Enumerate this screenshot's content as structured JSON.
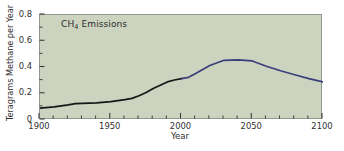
{
  "chart_data": {
    "type": "line",
    "title": "CH4 Emissions",
    "title_html": "CH<sub>4</sub> Emissions",
    "xlabel": "Year",
    "ylabel": "Teragrams Methane per Year",
    "xlim": [
      1900,
      2100
    ],
    "ylim": [
      0,
      0.8
    ],
    "grid": false,
    "legend": "none",
    "plot_background_color": "#ccd4c0",
    "xticks": [
      1900,
      1950,
      2000,
      2050,
      2100
    ],
    "xtick_labels": [
      "1900",
      "1950",
      "2000",
      "2050",
      "2100"
    ],
    "xminor_tick_interval": 10,
    "yticks": [
      0,
      0.2,
      0.4,
      0.6,
      0.8
    ],
    "ytick_labels": [
      "0",
      "0.2",
      "0.4",
      "0.6",
      "0.8"
    ],
    "yminor_tick_interval": 0.1,
    "series": [
      {
        "name": "Historical",
        "color": "#171717",
        "x": [
          1900,
          1910,
          1920,
          1925,
          1930,
          1940,
          1950,
          1960,
          1965,
          1970,
          1975,
          1980,
          1985,
          1990,
          1995,
          2000
        ],
        "values": [
          0.09,
          0.1,
          0.115,
          0.125,
          0.127,
          0.13,
          0.14,
          0.155,
          0.165,
          0.185,
          0.21,
          0.24,
          0.265,
          0.29,
          0.305,
          0.315
        ]
      },
      {
        "name": "Projection",
        "color": "#3a3f7a",
        "x": [
          2000,
          2005,
          2010,
          2020,
          2030,
          2040,
          2050,
          2060,
          2070,
          2080,
          2090,
          2100
        ],
        "values": [
          0.315,
          0.325,
          0.355,
          0.415,
          0.455,
          0.458,
          0.45,
          0.41,
          0.375,
          0.345,
          0.315,
          0.29
        ]
      }
    ]
  }
}
